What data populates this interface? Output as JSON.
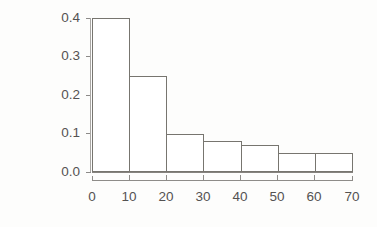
{
  "chart_data": {
    "type": "bar",
    "title": "",
    "subtitle": "",
    "xlabel": "",
    "ylabel": "relative frequency",
    "categories": [
      "0-10",
      "10-20",
      "20-30",
      "30-40",
      "40-50",
      "50-60",
      "60-70"
    ],
    "bin_edges": [
      0,
      10,
      20,
      30,
      40,
      50,
      60,
      70
    ],
    "values": [
      0.4,
      0.25,
      0.1,
      0.08,
      0.07,
      0.05,
      0.05
    ],
    "xlim": [
      0,
      70
    ],
    "ylim": [
      0.0,
      0.4
    ],
    "xticks": [
      0,
      10,
      20,
      30,
      40,
      50,
      60,
      70
    ],
    "yticks": [
      0.0,
      0.1,
      0.2,
      0.3,
      0.4
    ],
    "xtick_labels": [
      "0",
      "10",
      "20",
      "30",
      "40",
      "50",
      "60",
      "70"
    ],
    "ytick_labels": [
      "0.0",
      "0.1",
      "0.2",
      "0.3",
      "0.4"
    ],
    "grid": false,
    "legend": false,
    "legend_position": "none",
    "bar_fill_color": "#ffffff",
    "bar_edge_color": "#77756f",
    "axis_color": "#8e8c89",
    "text_color": "#545252",
    "background_color": "#fdfdfc"
  }
}
